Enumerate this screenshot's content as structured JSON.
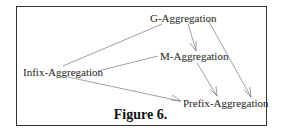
{
  "nodes": {
    "g": "G-Aggregation",
    "m": "M-Aggregation",
    "infix": "Infix-Aggregation",
    "prefix": "Prefix-Aggregation"
  },
  "edges": [
    {
      "from": "infix",
      "to": "g",
      "arrow": false
    },
    {
      "from": "infix",
      "to": "m",
      "arrow": false
    },
    {
      "from": "infix",
      "to": "prefix",
      "arrow": true
    },
    {
      "from": "g",
      "to": "m",
      "arrow": true
    },
    {
      "from": "g",
      "to": "prefix",
      "arrow": true
    },
    {
      "from": "m",
      "to": "prefix",
      "arrow": true
    }
  ],
  "caption": "Figure 6."
}
